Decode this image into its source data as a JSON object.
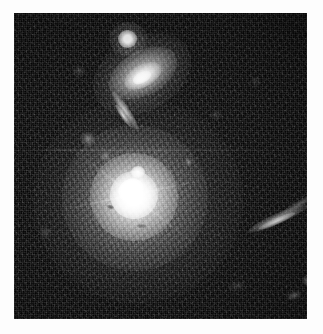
{
  "image": {
    "kind": "astronomical-observation",
    "title": "Galaxy field with bright central elliptical galaxy",
    "palette": {
      "background_sky": "#090909",
      "frame_matte": "#fdfdfd",
      "highlight": "#ffffff",
      "halo_gray": "#c8c8c8"
    },
    "frame": {
      "canvas_width": 323,
      "canvas_height": 334,
      "field_left": 14,
      "field_top": 13,
      "field_width": 293,
      "field_height": 306
    },
    "objects": [
      {
        "id": "central-galaxy",
        "name": "central-elliptical-galaxy",
        "type": "elliptical-galaxy",
        "center_x": 124,
        "center_y": 184,
        "brightness": "saturated-core",
        "note": "Bright nucleus with diffraction spikes and extended diffuse halo"
      },
      {
        "id": "upper-galaxy",
        "name": "upper-inclined-disk-galaxy",
        "type": "lenticular-galaxy",
        "center_x": 128,
        "center_y": 60,
        "position_angle_deg": -29,
        "brightness": "bright"
      },
      {
        "id": "top-star",
        "name": "compact-point-source",
        "type": "star",
        "center_x": 113,
        "center_y": 26,
        "brightness": "bright"
      },
      {
        "id": "edge-on-upper",
        "name": "edge-on-galaxy-upper-left",
        "type": "edge-on-spiral",
        "center_x": 111,
        "center_y": 97,
        "position_angle_deg": 56,
        "brightness": "moderate"
      },
      {
        "id": "edge-on-right",
        "name": "edge-on-galaxy-right",
        "type": "edge-on-spiral",
        "center_x": 264,
        "center_y": 205,
        "position_angle_deg": -24,
        "brightness": "moderate"
      }
    ],
    "artifacts": [
      {
        "id": "scanline",
        "name": "horizontal-scan-line",
        "y": 149
      }
    ]
  }
}
